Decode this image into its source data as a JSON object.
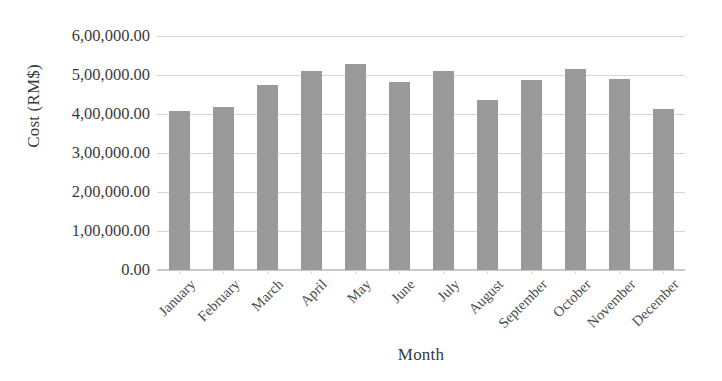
{
  "chart_data": {
    "type": "bar",
    "title": "",
    "xlabel": "Month",
    "ylabel": "Cost (RM$)",
    "categories": [
      "January",
      "February",
      "March",
      "April",
      "May",
      "June",
      "July",
      "August",
      "September",
      "October",
      "November",
      "December"
    ],
    "values": [
      408000,
      417000,
      475000,
      510000,
      528000,
      483000,
      511000,
      436000,
      488000,
      515000,
      490000,
      412000
    ],
    "series": [
      {
        "name": "Cost",
        "values": [
          408000,
          417000,
          475000,
          510000,
          528000,
          483000,
          511000,
          436000,
          488000,
          515000,
          490000,
          412000
        ]
      }
    ],
    "ylim": [
      0,
      600000
    ],
    "ytick_values": [
      0,
      100000,
      200000,
      300000,
      400000,
      500000,
      600000
    ],
    "ytick_labels": [
      "0.00",
      "1,00,000.00",
      "2,00,000.00",
      "3,00,000.00",
      "4,00,000.00",
      "5,00,000.00",
      "6,00,000.00"
    ],
    "grid": true,
    "legend": false,
    "legend_position": "none",
    "bar_color": "#9a9a9a",
    "gridline_color": "#d6d6d6",
    "xtick_rotation": -45
  }
}
